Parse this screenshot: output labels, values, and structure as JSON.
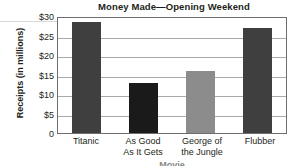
{
  "chart_data": {
    "type": "bar",
    "title": "Money Made—Opening Weekend",
    "xlabel": "Movie",
    "ylabel": "Receipts (in millions)",
    "categories": [
      "Titanic",
      "As Good As It Gets",
      "George of the Jungle",
      "Flubber"
    ],
    "category_lines": [
      [
        "Titanic"
      ],
      [
        "As Good",
        "As It Gets"
      ],
      [
        "George of",
        "the Jungle"
      ],
      [
        "Flubber"
      ]
    ],
    "values": [
      29,
      13,
      16.2,
      27.4
    ],
    "ylim": [
      0,
      30
    ],
    "ytick_values": [
      0,
      5,
      10,
      15,
      20,
      25,
      30
    ],
    "ytick_labels": [
      "0",
      "$5",
      "$10",
      "$15",
      "$20",
      "$25",
      "$30"
    ],
    "grid": true,
    "legend": "none",
    "bar_colors": [
      "#3f3f3f",
      "#1a1a1a",
      "#8c8c8c",
      "#3f3f3f"
    ],
    "axis_color": "#6d6e71",
    "gridline_color": "#a7a9ac",
    "text_color": "#231f20",
    "background": "#ffffff"
  }
}
